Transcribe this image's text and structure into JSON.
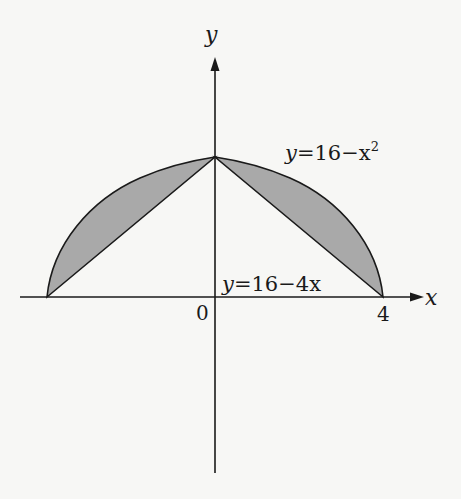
{
  "figure": {
    "axis_labels": {
      "x": "x",
      "y": "y"
    },
    "tick_labels": {
      "origin": "0",
      "x_right": "4"
    },
    "curves": [
      {
        "name": "parabola",
        "label_lhs": "y",
        "label_eq": "=16−x",
        "label_exp": "2"
      },
      {
        "name": "line",
        "label_lhs": "y",
        "label_eq": "=16−4x"
      }
    ],
    "colors": {
      "shade": "#a9a9a9",
      "stroke": "#1a1a1a",
      "background": "#f7f7f5"
    }
  }
}
